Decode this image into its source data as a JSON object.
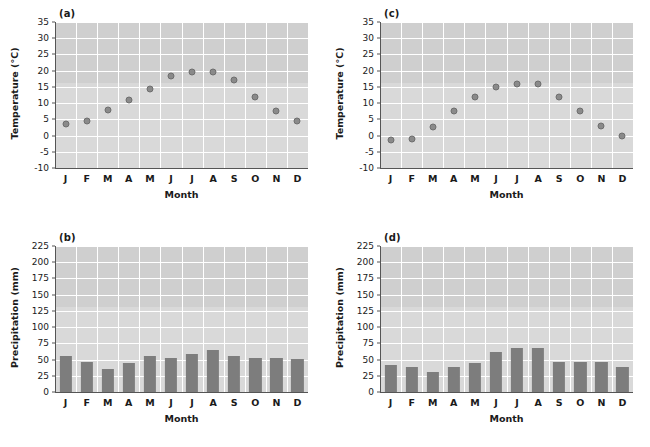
{
  "figure": {
    "type": "climate-figure",
    "background": "#ffffff",
    "plot_background": "#d9d9d9",
    "gridline_color": "#ffffff",
    "marker_color": "#8a8a8a",
    "marker_edge_color": "#6e6e6e",
    "bar_color": "#7d7d7d",
    "axis_color": "#555555"
  },
  "panels": [
    {
      "label": "(a)",
      "name": "panel-a-temperature"
    },
    {
      "label": "(c)",
      "name": "panel-c-temperature"
    },
    {
      "label": "(b)",
      "name": "panel-b-precipitation"
    },
    {
      "label": "(d)",
      "name": "panel-d-precipitation"
    }
  ],
  "chart_data": [
    {
      "panel": "(a)",
      "type": "scatter",
      "title": "",
      "xlabel": "Month",
      "ylabel": "Temperature (°C)",
      "categories": [
        "J",
        "F",
        "M",
        "A",
        "M",
        "J",
        "J",
        "A",
        "S",
        "O",
        "N",
        "D"
      ],
      "values": [
        3.5,
        4.5,
        8,
        11,
        14.5,
        18.5,
        19.5,
        19.5,
        17,
        12,
        7.5,
        4.5
      ],
      "ylim": [
        -10,
        35
      ],
      "yticks": [
        -10,
        -5,
        0,
        5,
        10,
        15,
        20,
        25,
        30,
        35
      ],
      "ytick_labels": [
        "-10",
        "-5",
        "0",
        "5",
        "10",
        "15",
        "20",
        "25",
        "30",
        "35"
      ],
      "grid": true,
      "legend": false
    },
    {
      "panel": "(c)",
      "type": "scatter",
      "title": "",
      "xlabel": "Month",
      "ylabel": "Temperature (°C)",
      "categories": [
        "J",
        "F",
        "M",
        "A",
        "M",
        "J",
        "J",
        "A",
        "S",
        "O",
        "N",
        "D"
      ],
      "values": [
        -1.5,
        -1,
        2.5,
        7.5,
        12,
        15,
        16,
        16,
        12,
        7.5,
        3,
        0
      ],
      "ylim": [
        -10,
        35
      ],
      "yticks": [
        -10,
        -5,
        0,
        5,
        10,
        15,
        20,
        25,
        30,
        35
      ],
      "ytick_labels": [
        "-10",
        "-5",
        "0",
        "5",
        "10",
        "15",
        "20",
        "25",
        "30",
        "35"
      ],
      "grid": true,
      "legend": false
    },
    {
      "panel": "(b)",
      "type": "bar",
      "title": "",
      "xlabel": "Month",
      "ylabel": "Precipitation (mm)",
      "categories": [
        "J",
        "F",
        "M",
        "A",
        "M",
        "J",
        "J",
        "A",
        "S",
        "O",
        "N",
        "D"
      ],
      "values": [
        56,
        46,
        35,
        44,
        56,
        53,
        59,
        65,
        56,
        52,
        52,
        51
      ],
      "ylim": [
        0,
        225
      ],
      "yticks": [
        0,
        25,
        50,
        75,
        100,
        125,
        150,
        175,
        200,
        225
      ],
      "ytick_labels": [
        "0",
        "25",
        "50",
        "75",
        "100",
        "125",
        "150",
        "175",
        "200",
        "225"
      ],
      "grid": true,
      "legend": false
    },
    {
      "panel": "(d)",
      "type": "bar",
      "title": "",
      "xlabel": "Month",
      "ylabel": "Precipitation (mm)",
      "categories": [
        "J",
        "F",
        "M",
        "A",
        "M",
        "J",
        "J",
        "A",
        "S",
        "O",
        "N",
        "D"
      ],
      "values": [
        42,
        39,
        31,
        39,
        45,
        62,
        68,
        68,
        47,
        47,
        47,
        39
      ],
      "ylim": [
        0,
        225
      ],
      "yticks": [
        0,
        25,
        50,
        75,
        100,
        125,
        150,
        175,
        200,
        225
      ],
      "ytick_labels": [
        "0",
        "25",
        "50",
        "75",
        "100",
        "125",
        "150",
        "175",
        "200",
        "225"
      ],
      "grid": true,
      "legend": false
    }
  ]
}
